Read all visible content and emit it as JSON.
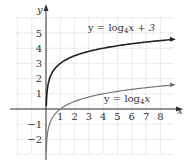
{
  "chart_data": {
    "type": "line",
    "title": "",
    "xlabel": "x",
    "ylabel": "y",
    "xlim": [
      -2,
      9
    ],
    "ylim": [
      -3,
      6
    ],
    "grid": true,
    "x_ticks": [
      "1",
      "2",
      "3",
      "4",
      "5",
      "6",
      "7",
      "8"
    ],
    "y_ticks": [
      "5",
      "4",
      "3",
      "2",
      "1",
      "-1",
      "-2"
    ],
    "series": [
      {
        "name": "y = log4x + 3",
        "function": "log4(x) + 3",
        "x": [
          0.05,
          0.25,
          1,
          2,
          4,
          8,
          9
        ],
        "values": [
          0.84,
          2,
          3,
          3.5,
          4,
          4.5,
          4.58
        ]
      },
      {
        "name": "y = log4x",
        "function": "log4(x)",
        "x": [
          0.05,
          0.25,
          1,
          2,
          4,
          8,
          9
        ],
        "values": [
          -2.16,
          -1,
          0,
          0.5,
          1,
          1.5,
          1.58
        ]
      }
    ],
    "annotations": [
      {
        "text": "y = log4x + 3",
        "near": [
          5.5,
          5
        ]
      },
      {
        "text": "y = log4x",
        "near": [
          6,
          0.6
        ]
      }
    ]
  },
  "labels": {
    "x_axis": "x",
    "y_axis": "y",
    "curve_upper": {
      "pre": "y = log",
      "sub": "4",
      "post": "x + 3"
    },
    "curve_lower": {
      "pre": "y = log",
      "sub": "4",
      "post": "x"
    }
  }
}
